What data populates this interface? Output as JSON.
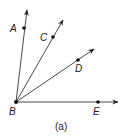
{
  "diagram": {
    "caption": "(a)",
    "vertex": {
      "label": "B",
      "x": 16,
      "y": 102
    },
    "rays": [
      {
        "name": "BA",
        "point_label": "A",
        "point": [
          24,
          28
        ],
        "tip": [
          27,
          9
        ]
      },
      {
        "name": "BC",
        "point_label": "C",
        "point": [
          53,
          37
        ],
        "tip": [
          63,
          19
        ]
      },
      {
        "name": "BD",
        "point_label": "D",
        "point": [
          78,
          60
        ],
        "tip": [
          95,
          48
        ]
      },
      {
        "name": "BE",
        "point_label": "E",
        "point": [
          98,
          102
        ],
        "tip": [
          119,
          102
        ]
      }
    ],
    "colors": {
      "line": "#333333",
      "point": "#111111",
      "text": "#1a1a1a"
    }
  }
}
